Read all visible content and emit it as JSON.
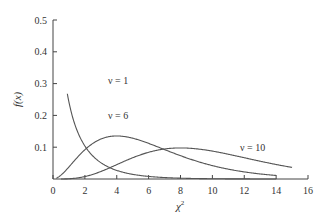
{
  "chart_data": {
    "type": "line",
    "title": "",
    "xlabel": "χ²",
    "ylabel": "f(x)",
    "xlim": [
      0,
      16
    ],
    "ylim": [
      0,
      0.5
    ],
    "x_ticks": [
      "0",
      "2",
      "4",
      "6",
      "8",
      "10",
      "12",
      "14",
      "16"
    ],
    "y_ticks": [
      "0.1",
      "0.2",
      "0.3",
      "0.4",
      "0.5"
    ],
    "grid": false,
    "legend": "inline labels",
    "series": [
      {
        "name": "ν = 1",
        "df": 1,
        "label": "ν = 1",
        "x_range": [
          0.9,
          14
        ],
        "peak": "unbounded near 0"
      },
      {
        "name": "ν = 6",
        "df": 6,
        "label": "ν = 6",
        "x_range": [
          0.2,
          14
        ],
        "peak": {
          "x": 2.0,
          "y": 0.18
        }
      },
      {
        "name": "ν = 10",
        "df": 10,
        "label": "ν = 10",
        "x_range": [
          0.5,
          15
        ],
        "peak": {
          "x": 6.0,
          "y": 0.11
        }
      }
    ]
  },
  "labels": {
    "nu1": "ν = 1",
    "nu6": "ν = 6",
    "nu10": "ν = 10",
    "xlabel": "χ",
    "xlabel_sup": "2",
    "ylabel": "f(x)"
  }
}
